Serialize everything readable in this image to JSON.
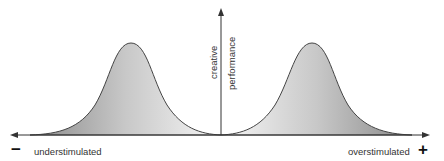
{
  "diagram": {
    "y_axis_label_line1": "creative",
    "y_axis_label_line2": "performance",
    "left_label": "understimulated",
    "right_label": "overstimulated",
    "left_symbol": "−",
    "right_symbol": "+",
    "colors": {
      "curve_stroke": "#444444",
      "axis": "#333333",
      "fill_light": "#f4f4f4",
      "fill_dark": "#9a9a9a"
    }
  }
}
